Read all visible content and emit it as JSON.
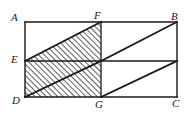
{
  "figure": {
    "stroke_color": "#1a1a1a",
    "hatch_color": "#1a1a1a",
    "background_color": "#ffffff",
    "labels": {
      "A": "A",
      "B": "B",
      "C": "C",
      "D": "D",
      "E": "E",
      "F": "F",
      "G": "G"
    },
    "points": {
      "A": [
        25,
        22
      ],
      "B": [
        177,
        22
      ],
      "C": [
        177,
        97
      ],
      "D": [
        25,
        97
      ],
      "E": [
        25,
        61
      ],
      "F": [
        101,
        22
      ],
      "G": [
        101,
        97
      ],
      "M": [
        101,
        61
      ]
    },
    "segments": [
      {
        "name": "side-AB",
        "from": "A",
        "to": "B"
      },
      {
        "name": "side-BC",
        "from": "B",
        "to": "C"
      },
      {
        "name": "side-CD",
        "from": "C",
        "to": "D"
      },
      {
        "name": "side-DA",
        "from": "D",
        "to": "A"
      },
      {
        "name": "segment-FG",
        "from": "F",
        "to": "G"
      },
      {
        "name": "segment-EC",
        "from": "E",
        "to": "C"
      },
      {
        "name": "diagonal-EF",
        "from": "E",
        "to": "F"
      },
      {
        "name": "diagonal-MB",
        "from": "M",
        "to": "B"
      },
      {
        "name": "diagonal-DM",
        "from": "D",
        "to": "M"
      },
      {
        "name": "diagonal-GBright",
        "from": "G",
        "to": "BC-midpoint"
      }
    ],
    "shaded_regions": [
      {
        "name": "triangle-E-F-M",
        "vertices": [
          "E",
          "F",
          "M"
        ]
      },
      {
        "name": "rectangle-E-M-G-D",
        "vertices": [
          "E",
          "M",
          "G",
          "D"
        ]
      }
    ]
  }
}
